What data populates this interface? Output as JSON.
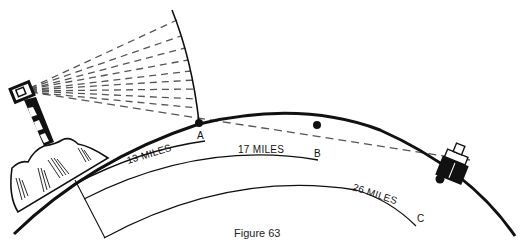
{
  "figure": {
    "caption": "Figure 63",
    "labels": {
      "point_a": "A",
      "point_b": "B",
      "point_c": "C",
      "dist_13": "13 MILES",
      "dist_17": "17 MILES",
      "dist_26": "26 MILES"
    },
    "elements": [
      "lighthouse",
      "light-beam-rays",
      "earth-curvature",
      "line-of-sight",
      "ship",
      "horizon-points"
    ],
    "colors": {
      "ink": "#111111",
      "dash": "#555555",
      "background": "#ffffff"
    }
  }
}
